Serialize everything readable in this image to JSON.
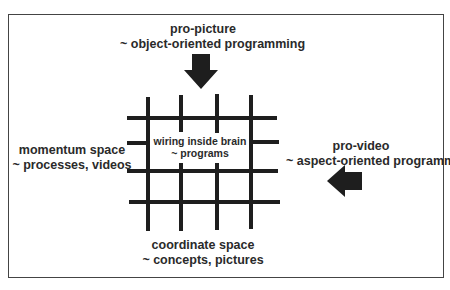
{
  "diagram": {
    "top_label": {
      "line1": "pro-picture",
      "line2": "~ object-oriented programming"
    },
    "left_label": {
      "line1": "momentum space",
      "line2": "~ processes, videos"
    },
    "center_label": {
      "line1": "wiring inside brain",
      "line2": "~ programs"
    },
    "right_label": {
      "line1": "pro-video",
      "line2": "~ aspect-oriented programming"
    },
    "bottom_label": {
      "line1": "coordinate space",
      "line2": "~ concepts, pictures"
    },
    "arrows": [
      {
        "name": "down-arrow",
        "direction": "down",
        "points_to": "grid",
        "from": "pro-picture"
      },
      {
        "name": "left-arrow",
        "direction": "left",
        "points_to": "grid",
        "from": "pro-video"
      }
    ],
    "grid": {
      "vertical_lines": 4,
      "horizontal_lines": 4
    },
    "colors": {
      "ink": "#1e1e1e",
      "frame": "#444444",
      "background": "#ffffff"
    }
  }
}
